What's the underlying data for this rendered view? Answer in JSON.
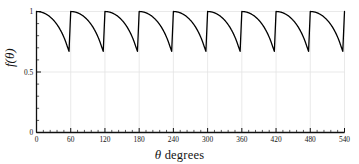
{
  "chart_data": {
    "type": "line",
    "title": "",
    "subtitle": "",
    "xlabel": "θ degrees",
    "xlabel_symbol": "θ",
    "xlabel_rest": " degrees",
    "ylabel": "f(θ)",
    "xlim": [
      0,
      540
    ],
    "ylim": [
      0,
      1
    ],
    "xticks": [
      0,
      60,
      120,
      180,
      240,
      300,
      360,
      420,
      480,
      540
    ],
    "xtick_labels": [
      "0",
      "60",
      "120",
      "180",
      "240",
      "300",
      "360",
      "420",
      "480",
      "540"
    ],
    "x_minor_tick_step": 12,
    "yticks": [
      0,
      0.5,
      1
    ],
    "ytick_labels": [
      "0",
      "0.5",
      "1"
    ],
    "y_minor_tick_step": 0.1,
    "grid": true,
    "grid_color": "#e3e3e3",
    "legend": null,
    "line_color": "#000000",
    "line_width": 1.3,
    "period_degrees": 60,
    "num_cycles": 9,
    "peak_value": 1.0,
    "min_value": 0.67,
    "min_at_degrees_in_period": 45,
    "series": [
      {
        "name": "f(θ)",
        "description": "periodic lobed function, 9 cycles of 60 degrees, max 1.0 at cycle start and end, sharp minimum 0.67 at 45 degrees into each cycle",
        "x": [
          0,
          3,
          6,
          9,
          12,
          15,
          18,
          21,
          24,
          27,
          30,
          33,
          36,
          39,
          42,
          45,
          48,
          51,
          54,
          57,
          60
        ],
        "values": [
          1.0,
          0.9993,
          0.9973,
          0.9939,
          0.9891,
          0.9829,
          0.9752,
          0.9659,
          0.9549,
          0.9422,
          0.9276,
          0.9109,
          0.8921,
          0.8707,
          0.8465,
          0.8191,
          0.788,
          0.7524,
          0.7113,
          0.6704,
          1.0
        ]
      }
    ]
  }
}
